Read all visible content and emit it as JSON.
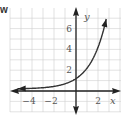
{
  "corner_label": "w",
  "chart_data": {
    "type": "line",
    "title": "",
    "function": "y = 2^x",
    "xlabel": "x",
    "ylabel": "y",
    "xlim": [
      -6,
      4
    ],
    "ylim": [
      -2,
      8
    ],
    "grid": true,
    "x_ticks": [
      {
        "value": -4,
        "label": "−4"
      },
      {
        "value": -2,
        "label": "−2"
      },
      {
        "value": 2,
        "label": "2"
      }
    ],
    "y_ticks": [
      {
        "value": 2,
        "label": "2"
      },
      {
        "value": 4,
        "label": "4"
      },
      {
        "value": 6,
        "label": "6"
      }
    ],
    "series": [
      {
        "name": "exponential curve",
        "x": [
          -5.5,
          -4,
          -3,
          -2,
          -1,
          0,
          1,
          2,
          2.5,
          2.8
        ],
        "y": [
          0.02,
          0.06,
          0.13,
          0.25,
          0.5,
          1,
          2,
          4,
          5.66,
          6.96
        ]
      }
    ],
    "colors": {
      "axis": "#222222",
      "curve": "#333333",
      "grid": "#cfcfcf"
    }
  }
}
